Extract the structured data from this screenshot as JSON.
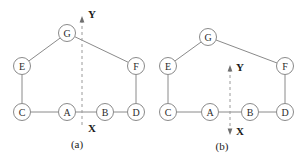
{
  "figure": {
    "background_color": "#ffffff",
    "node_stroke_color": "#8a8a8a",
    "edge_color": "#8a8a8a",
    "axis_color": "#9a9a9a",
    "text_color": "#1a1a1a"
  },
  "panels": [
    {
      "id": "a",
      "caption": "(a)",
      "caption_x": 77,
      "caption_y": 144,
      "nodes": [
        {
          "label": "A",
          "x": 67,
          "y": 112,
          "r": 8.5
        },
        {
          "label": "B",
          "x": 105,
          "y": 112,
          "r": 8.5
        },
        {
          "label": "C",
          "x": 22,
          "y": 112,
          "r": 8.5
        },
        {
          "label": "D",
          "x": 136,
          "y": 112,
          "r": 8.5
        },
        {
          "label": "E",
          "x": 22,
          "y": 66,
          "r": 8.5
        },
        {
          "label": "F",
          "x": 136,
          "y": 66,
          "r": 8.5
        },
        {
          "label": "G",
          "x": 67,
          "y": 33,
          "r": 8.5
        }
      ],
      "edges": [
        {
          "from": "C",
          "to": "A"
        },
        {
          "from": "A",
          "to": "B"
        },
        {
          "from": "B",
          "to": "D"
        },
        {
          "from": "C",
          "to": "E"
        },
        {
          "from": "E",
          "to": "G"
        },
        {
          "from": "G",
          "to": "F"
        },
        {
          "from": "F",
          "to": "D"
        }
      ],
      "axis": {
        "x_position": 82,
        "y_top": 20,
        "y_bottom": 128,
        "y_axis_label": "Y",
        "y_label_x": 92,
        "y_label_y": 14,
        "x_axis_label": "X",
        "x_label_x": 92,
        "x_label_y": 128,
        "y_arrow": true,
        "x_arrow": false
      }
    },
    {
      "id": "b",
      "caption": "(b)",
      "caption_x": 222,
      "caption_y": 146,
      "nodes": [
        {
          "label": "A",
          "x": 210,
          "y": 112,
          "r": 8.5
        },
        {
          "label": "B",
          "x": 250,
          "y": 112,
          "r": 8.5
        },
        {
          "label": "C",
          "x": 168,
          "y": 112,
          "r": 8.5
        },
        {
          "label": "D",
          "x": 285,
          "y": 112,
          "r": 8.5
        },
        {
          "label": "E",
          "x": 168,
          "y": 66,
          "r": 8.5
        },
        {
          "label": "F",
          "x": 285,
          "y": 66,
          "r": 8.5
        },
        {
          "label": "G",
          "x": 208,
          "y": 37,
          "r": 8.5
        }
      ],
      "edges": [
        {
          "from": "C",
          "to": "A"
        },
        {
          "from": "A",
          "to": "B"
        },
        {
          "from": "B",
          "to": "D"
        },
        {
          "from": "C",
          "to": "E"
        },
        {
          "from": "E",
          "to": "G"
        },
        {
          "from": "G",
          "to": "F"
        },
        {
          "from": "F",
          "to": "D"
        }
      ],
      "axis": {
        "x_position": 230,
        "y_top": 69,
        "y_bottom": 131,
        "y_axis_label": "Y",
        "y_label_x": 240,
        "y_label_y": 67,
        "x_axis_label": "X",
        "x_label_x": 240,
        "x_label_y": 131,
        "y_arrow": true,
        "x_arrow": true
      }
    }
  ]
}
